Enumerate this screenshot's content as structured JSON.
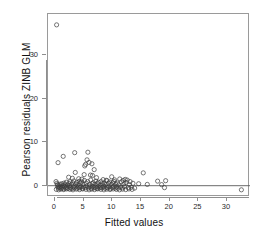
{
  "figure": {
    "background": "#ffffff",
    "plot_box": {
      "left": 47,
      "top": 13,
      "width": 202,
      "height": 183,
      "border_color": "#9a9a9a"
    }
  },
  "axes": {
    "x_title": "Fitted values",
    "y_title": "Pearson residuals ZINB GLM",
    "x_ticks": [
      "0",
      "5",
      "10",
      "15",
      "20",
      "25",
      "30"
    ],
    "y_ticks": [
      "0",
      "10",
      "20",
      "30"
    ],
    "tick_color": "#8e8e8e"
  },
  "chart_data": {
    "type": "scatter",
    "title": "",
    "xlabel": "Fitted values",
    "ylabel": "Pearson residuals ZINB GLM",
    "xlim": [
      -1.2,
      34.0
    ],
    "ylim": [
      -2.6,
      39.5
    ],
    "xticks": [
      0,
      5,
      10,
      15,
      20,
      25,
      30
    ],
    "yticks": [
      0,
      10,
      20,
      30
    ],
    "grid": false,
    "legend": null,
    "marker": {
      "shape": "open-circle",
      "radius_px": 2.1,
      "stroke": "#3c3c3c",
      "stroke_width": 0.7,
      "fill": "none"
    },
    "reference_lines": [
      {
        "orientation": "horizontal",
        "y": 0,
        "color": "#5a5a5a",
        "width": 0.9
      }
    ],
    "annotations": [
      {
        "text": "extreme positive outlier near x=0.3, y=37",
        "x": 0.3,
        "y": 37.0
      }
    ],
    "series": [
      {
        "name": "Pearson residuals",
        "points": [
          [
            0.3,
            37.0
          ],
          [
            0.55,
            5.3
          ],
          [
            1.45,
            6.75
          ],
          [
            3.45,
            7.6
          ],
          [
            5.75,
            7.7
          ],
          [
            5.6,
            5.95
          ],
          [
            5.95,
            5.35
          ],
          [
            5.35,
            4.9
          ],
          [
            5.2,
            4.55
          ],
          [
            6.45,
            5.05
          ],
          [
            6.85,
            3.7
          ],
          [
            3.55,
            3.05
          ],
          [
            5.1,
            2.55
          ],
          [
            6.2,
            2.45
          ],
          [
            6.55,
            2.35
          ],
          [
            15.4,
            2.95
          ],
          [
            9.9,
            2.05
          ],
          [
            11.3,
            1.55
          ],
          [
            12.25,
            1.45
          ],
          [
            12.6,
            1.3
          ],
          [
            17.9,
            1.05
          ],
          [
            19.3,
            1.15
          ],
          [
            2.4,
            1.95
          ],
          [
            3.05,
            1.7
          ],
          [
            4.15,
            1.6
          ],
          [
            4.7,
            1.5
          ],
          [
            7.25,
            1.85
          ],
          [
            8.4,
            1.4
          ],
          [
            8.95,
            1.25
          ],
          [
            10.4,
            1.35
          ],
          [
            11.9,
            1.2
          ],
          [
            13.1,
            0.95
          ],
          [
            14.6,
            0.45
          ],
          [
            16.1,
            0.3
          ],
          [
            18.6,
            0.25
          ],
          [
            19.1,
            -0.45
          ],
          [
            32.5,
            -0.95
          ],
          [
            0.2,
            0.95
          ],
          [
            0.35,
            0.55
          ],
          [
            0.45,
            0.2
          ],
          [
            0.5,
            -0.25
          ],
          [
            0.6,
            -0.55
          ],
          [
            0.7,
            0.1
          ],
          [
            0.8,
            -0.4
          ],
          [
            0.9,
            0.35
          ],
          [
            1.0,
            -0.15
          ],
          [
            1.1,
            -0.6
          ],
          [
            1.2,
            0.45
          ],
          [
            1.3,
            -0.35
          ],
          [
            1.4,
            0.05
          ],
          [
            1.5,
            -0.7
          ],
          [
            1.6,
            0.6
          ],
          [
            1.7,
            -0.2
          ],
          [
            1.8,
            0.25
          ],
          [
            1.9,
            -0.5
          ],
          [
            2.0,
            0.8
          ],
          [
            2.1,
            -0.3
          ],
          [
            2.2,
            0.15
          ],
          [
            2.3,
            -0.65
          ],
          [
            2.45,
            0.5
          ],
          [
            2.55,
            -0.1
          ],
          [
            2.65,
            0.9
          ],
          [
            2.75,
            -0.45
          ],
          [
            2.85,
            0.3
          ],
          [
            2.95,
            -0.7
          ],
          [
            3.1,
            0.65
          ],
          [
            3.2,
            -0.25
          ],
          [
            3.3,
            1.1
          ],
          [
            3.4,
            -0.55
          ],
          [
            3.6,
            0.4
          ],
          [
            3.7,
            -0.15
          ],
          [
            3.8,
            0.75
          ],
          [
            3.9,
            -0.6
          ],
          [
            4.0,
            0.2
          ],
          [
            4.1,
            -0.35
          ],
          [
            4.25,
            1.0
          ],
          [
            4.35,
            -0.5
          ],
          [
            4.45,
            0.55
          ],
          [
            4.55,
            -0.2
          ],
          [
            4.65,
            0.85
          ],
          [
            4.8,
            -0.65
          ],
          [
            4.9,
            0.35
          ],
          [
            5.0,
            -0.3
          ],
          [
            5.15,
            1.2
          ],
          [
            5.3,
            -0.45
          ],
          [
            5.45,
            0.6
          ],
          [
            5.55,
            -0.1
          ],
          [
            5.7,
            0.95
          ],
          [
            5.85,
            -0.55
          ],
          [
            6.0,
            0.25
          ],
          [
            6.1,
            -0.25
          ],
          [
            6.25,
            1.3
          ],
          [
            6.35,
            -0.6
          ],
          [
            6.5,
            0.45
          ],
          [
            6.6,
            -0.15
          ],
          [
            6.7,
            0.7
          ],
          [
            6.8,
            -0.5
          ],
          [
            6.95,
            0.3
          ],
          [
            7.05,
            -0.35
          ],
          [
            7.15,
            1.05
          ],
          [
            7.3,
            -0.65
          ],
          [
            7.4,
            0.5
          ],
          [
            7.5,
            -0.2
          ],
          [
            7.6,
            0.8
          ],
          [
            7.75,
            -0.55
          ],
          [
            7.85,
            0.15
          ],
          [
            7.95,
            -0.3
          ],
          [
            8.05,
            0.95
          ],
          [
            8.2,
            -0.45
          ],
          [
            8.3,
            0.4
          ],
          [
            8.5,
            -0.1
          ],
          [
            8.6,
            0.65
          ],
          [
            8.7,
            -0.6
          ],
          [
            8.8,
            0.25
          ],
          [
            9.0,
            -0.35
          ],
          [
            9.1,
            1.15
          ],
          [
            9.2,
            -0.5
          ],
          [
            9.35,
            0.55
          ],
          [
            9.45,
            -0.2
          ],
          [
            9.55,
            0.85
          ],
          [
            9.7,
            -0.65
          ],
          [
            9.8,
            0.3
          ],
          [
            10.0,
            -0.4
          ],
          [
            10.1,
            0.7
          ],
          [
            10.2,
            -0.15
          ],
          [
            10.3,
            1.0
          ],
          [
            10.5,
            -0.55
          ],
          [
            10.6,
            0.35
          ],
          [
            10.75,
            -0.25
          ],
          [
            10.85,
            0.6
          ],
          [
            11.0,
            -0.6
          ],
          [
            11.1,
            0.2
          ],
          [
            11.45,
            -0.3
          ],
          [
            11.6,
            0.9
          ],
          [
            11.75,
            -0.5
          ],
          [
            12.0,
            0.45
          ],
          [
            12.1,
            -0.2
          ],
          [
            12.4,
            0.75
          ],
          [
            12.8,
            -0.45
          ],
          [
            13.0,
            0.25
          ],
          [
            13.3,
            -0.35
          ],
          [
            13.6,
            0.55
          ],
          [
            13.9,
            -0.55
          ],
          [
            0.25,
            -0.85
          ],
          [
            0.65,
            -0.95
          ],
          [
            1.05,
            -0.8
          ],
          [
            1.55,
            -0.9
          ],
          [
            2.05,
            -0.75
          ],
          [
            2.6,
            -0.85
          ],
          [
            3.15,
            -0.95
          ],
          [
            3.75,
            -0.8
          ],
          [
            4.3,
            -0.9
          ],
          [
            4.85,
            -0.75
          ],
          [
            5.4,
            -0.85
          ],
          [
            5.95,
            -0.95
          ],
          [
            6.4,
            -0.8
          ],
          [
            6.9,
            -0.9
          ],
          [
            7.45,
            -0.75
          ],
          [
            8.0,
            -0.85
          ],
          [
            8.55,
            -0.95
          ],
          [
            9.05,
            -0.8
          ],
          [
            9.6,
            -0.9
          ],
          [
            10.15,
            -0.75
          ],
          [
            10.7,
            -0.85
          ],
          [
            11.25,
            -0.95
          ],
          [
            11.8,
            -0.8
          ],
          [
            12.35,
            -0.9
          ],
          [
            12.9,
            -0.75
          ],
          [
            13.45,
            -0.85
          ]
        ]
      }
    ]
  }
}
